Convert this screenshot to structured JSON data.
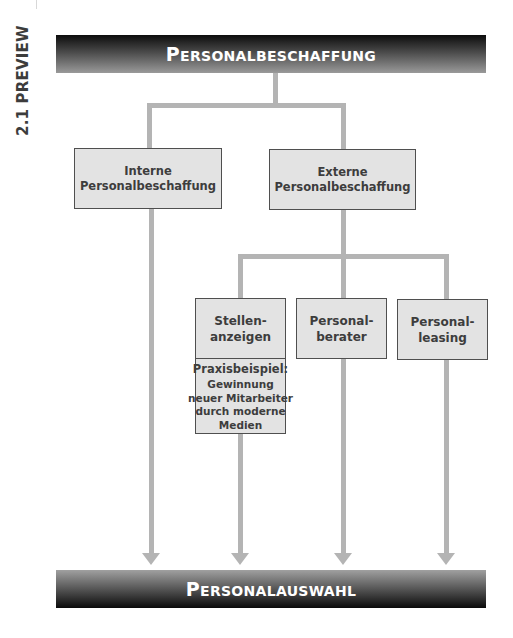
{
  "side_label": "2.1 PREVIEW",
  "top_bar": {
    "first_letter": "P",
    "rest": "ERSONALBESCHAFFUNG",
    "label": "Personalbeschaffung"
  },
  "bottom_bar": {
    "first_letter": "P",
    "rest": "ERSONALAUSWAHL",
    "label": "Personalauswahl"
  },
  "level1": [
    {
      "line1": "Interne",
      "line2": "Personalbeschaffung"
    },
    {
      "line1": "Externe",
      "line2": "Personalbeschaffung"
    }
  ],
  "level2": [
    {
      "line1": "Stellen-",
      "line2": "anzeigen"
    },
    {
      "line1": "Personal-",
      "line2": "berater"
    },
    {
      "line1": "Personal-",
      "line2": "leasing"
    }
  ],
  "example": {
    "title": "Praxisbeispiel:",
    "lines": [
      "Gewinnung",
      "neuer Mitarbeiter",
      "durch moderne",
      "Medien"
    ]
  },
  "colors": {
    "connector": "#b4b4b4",
    "box_fill": "#e3e3e3",
    "box_border": "#4f4f4f",
    "text": "#3d3d3d",
    "bar_dark": "#0c0c0c",
    "bar_light": "#9a9a9a"
  }
}
